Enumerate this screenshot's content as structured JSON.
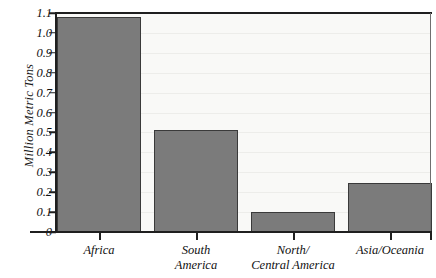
{
  "chart_data": {
    "type": "bar",
    "title": "",
    "xlabel": "",
    "ylabel": "Million Metric Tons",
    "categories": [
      "Africa",
      "South America",
      "North/ Central America",
      "Asia/Oceania"
    ],
    "category_lines": [
      [
        "Africa"
      ],
      [
        "South",
        "America"
      ],
      [
        "North/",
        "Central America"
      ],
      [
        "Asia/Oceania"
      ]
    ],
    "values": [
      1.08,
      0.51,
      0.1,
      0.245
    ],
    "ylim": [
      0,
      1.1
    ],
    "ytick_values": [
      0,
      0.1,
      0.2,
      0.3,
      0.4,
      0.5,
      0.6,
      0.7,
      0.8,
      0.9,
      1.0,
      1.1
    ],
    "ytick_labels": [
      "0",
      "0.1",
      "0.2",
      "0.3",
      "0.4",
      "0.5",
      "0.6",
      "0.7",
      "0.8",
      "0.9",
      "1.0",
      "1.1"
    ],
    "grid": "faint-horizontal",
    "legend": "none",
    "colors": {
      "bar_fill": "#7b7b7b",
      "bar_edge": "#3a3a3a",
      "axis": "#1f1f1f",
      "plot_background": "#f9f9f7",
      "page_background": "#ffffff",
      "gridline": "#ededea"
    }
  }
}
